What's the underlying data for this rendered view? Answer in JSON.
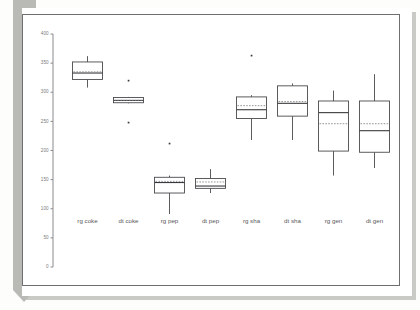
{
  "figure": {
    "kind": "scanned-boxplot-figure",
    "background_color": "#ffffff",
    "binding_color": "#b9b9b6",
    "frame_color": "#6f6f72"
  },
  "chart_data": {
    "type": "bar",
    "plot_kind": "boxplot",
    "title": "",
    "subtitle": "",
    "xlabel": "",
    "ylabel": "",
    "grid": false,
    "legend": "none",
    "ylim": [
      0,
      400
    ],
    "yticks": [
      0,
      50,
      100,
      150,
      200,
      250,
      300,
      350,
      400
    ],
    "ytick_labels": [
      "0",
      "50",
      "100",
      "150",
      "200",
      "250",
      "300",
      "350",
      "400"
    ],
    "categories": [
      "rg coke",
      "dt coke",
      "rg pep",
      "dt pep",
      "rg sha",
      "dt sha",
      "rg gen",
      "dt gen"
    ],
    "boxes": [
      {
        "category": "rg coke",
        "whisker_low": 308,
        "q1": 322,
        "median": 333,
        "mean": 335,
        "q3": 352,
        "whisker_high": 362,
        "outliers": []
      },
      {
        "category": "dt coke",
        "whisker_low": 281,
        "q1": 282,
        "median": 286,
        "mean": 286,
        "q3": 291,
        "whisker_high": 292,
        "outliers": [
          320,
          248
        ]
      },
      {
        "category": "rg pep",
        "whisker_low": 91,
        "q1": 127,
        "median": 145,
        "mean": 147,
        "q3": 154,
        "whisker_high": 157,
        "outliers": [
          212
        ]
      },
      {
        "category": "dt pep",
        "whisker_low": 127,
        "q1": 135,
        "median": 139,
        "mean": 146,
        "q3": 152,
        "whisker_high": 168,
        "outliers": []
      },
      {
        "category": "rg sha",
        "whisker_low": 218,
        "q1": 255,
        "median": 270,
        "mean": 277,
        "q3": 292,
        "whisker_high": 295,
        "outliers": [
          363
        ]
      },
      {
        "category": "dt sha",
        "whisker_low": 218,
        "q1": 259,
        "median": 281,
        "mean": 284,
        "q3": 311,
        "whisker_high": 315,
        "outliers": []
      },
      {
        "category": "rg gen",
        "whisker_low": 157,
        "q1": 199,
        "median": 265,
        "mean": 246,
        "q3": 285,
        "whisker_high": 303,
        "outliers": []
      },
      {
        "category": "dt gen",
        "whisker_low": 170,
        "q1": 197,
        "median": 234,
        "mean": 246,
        "q3": 285,
        "whisker_high": 331,
        "outliers": []
      }
    ]
  }
}
